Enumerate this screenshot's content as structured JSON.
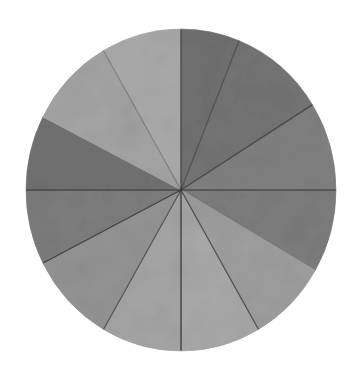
{
  "figure": {
    "background": "#ffffff",
    "center": [
      181,
      190
    ],
    "radius_x": 155,
    "radius_y": 161,
    "divider_color": "#3a3a3a",
    "wedges": [
      {
        "start": 0,
        "end": 22,
        "fill": "#6a6a6a"
      },
      {
        "start": 22,
        "end": 58,
        "fill": "#6e6e6e"
      },
      {
        "start": 58,
        "end": 90,
        "fill": "#7b7b7b"
      },
      {
        "start": 90,
        "end": 120,
        "fill": "#777777"
      },
      {
        "start": 120,
        "end": 150,
        "fill": "#9a9a9a"
      },
      {
        "start": 150,
        "end": 180,
        "fill": "#a5a5a5"
      },
      {
        "start": 180,
        "end": 210,
        "fill": "#a1a1a1"
      },
      {
        "start": 210,
        "end": 243,
        "fill": "#8f8f8f"
      },
      {
        "start": 243,
        "end": 270,
        "fill": "#777777"
      },
      {
        "start": 270,
        "end": 297,
        "fill": "#6b6b6b"
      },
      {
        "start": 297,
        "end": 330,
        "fill": "#a0a0a0"
      },
      {
        "start": 330,
        "end": 360,
        "fill": "#a6a6a6"
      }
    ],
    "dividers": [
      {
        "angle": 0,
        "opacity": 0.9
      },
      {
        "angle": 22,
        "opacity": 0.6
      },
      {
        "angle": 58,
        "opacity": 0.8
      },
      {
        "angle": 90,
        "opacity": 0.7
      },
      {
        "angle": 150,
        "opacity": 0.8
      },
      {
        "angle": 180,
        "opacity": 1.0
      },
      {
        "angle": 210,
        "opacity": 0.7
      },
      {
        "angle": 243,
        "opacity": 0.9
      },
      {
        "angle": 270,
        "opacity": 0.7
      },
      {
        "angle": 330,
        "opacity": 0.35
      }
    ]
  }
}
